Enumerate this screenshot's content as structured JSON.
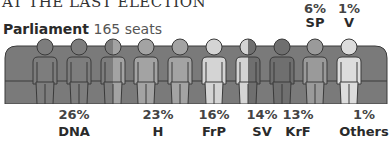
{
  "header": {
    "kicker": "AT THE LAST ELECTION",
    "title_bold": "Parliament",
    "title_rest": "165 seats"
  },
  "top_labels": [
    {
      "pct": "6%",
      "party": "SP",
      "x": 315
    },
    {
      "pct": "1%",
      "party": "V",
      "x": 349
    }
  ],
  "bottom_labels": [
    {
      "pct": "26%",
      "party": "DNA",
      "x": 74
    },
    {
      "pct": "23%",
      "party": "H",
      "x": 158
    },
    {
      "pct": "16%",
      "party": "FrP",
      "x": 214
    },
    {
      "pct": "14%",
      "party": "SV",
      "x": 262
    },
    {
      "pct": "13%",
      "party": "KrF",
      "x": 298
    },
    {
      "pct": "1%",
      "party": "Others",
      "x": 364
    }
  ],
  "figures": [
    {
      "x": 45,
      "color": "#7d7d7d"
    },
    {
      "x": 79,
      "color": "#7d7d7d"
    },
    {
      "x": 113,
      "color": "#7d7d7d",
      "split": "#a3a3a3"
    },
    {
      "x": 146,
      "color": "#a3a3a3"
    },
    {
      "x": 180,
      "color": "#a3a3a3"
    },
    {
      "x": 214,
      "color": "#d4d4d4"
    },
    {
      "x": 248,
      "color": "#d4d4d4",
      "split": "#6f6f6f"
    },
    {
      "x": 282,
      "color": "#6f6f6f"
    },
    {
      "x": 315,
      "color": "#9a9a9a"
    },
    {
      "x": 349,
      "color": "#dcdcdc"
    }
  ],
  "colors": {
    "sofa": "#7a7a7a",
    "sofa_edge": "#3a3a3a"
  },
  "chart_data": {
    "type": "pictogram",
    "title": "Parliament 165 seats",
    "subtitle": "AT THE LAST ELECTION",
    "categories": [
      "DNA",
      "H",
      "FrP",
      "SV",
      "KrF",
      "SP",
      "V",
      "Others"
    ],
    "values": [
      26,
      23,
      16,
      14,
      13,
      6,
      1,
      1
    ],
    "unit": "%",
    "total_seats": 165
  }
}
